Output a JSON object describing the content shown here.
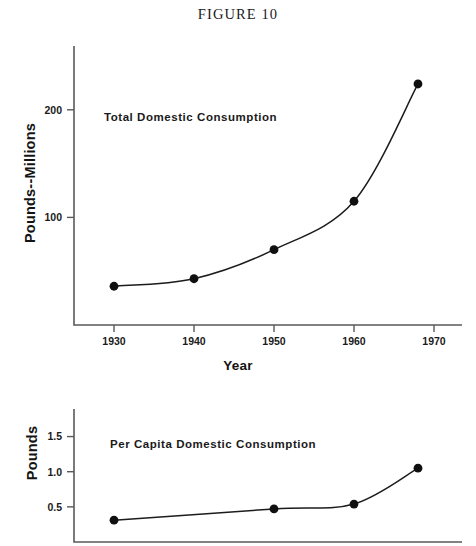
{
  "figure": {
    "title": "FIGURE  10"
  },
  "chart_data": [
    {
      "id": "total-domestic-consumption",
      "type": "line",
      "title": "Total Domestic Consumption",
      "annotation": "Total Domestic Consumption",
      "xlabel": "Year",
      "ylabel": "Pounds--Millions",
      "x": [
        1930,
        1940,
        1950,
        1960,
        1968
      ],
      "values": [
        36,
        43,
        70,
        115,
        224
      ],
      "xticks": [
        1930,
        1940,
        1950,
        1960,
        1970
      ],
      "xticklabels": [
        "1930",
        "1940",
        "1950",
        "1960",
        "1970"
      ],
      "yticks": [
        100,
        200
      ],
      "yticklabels": [
        "100",
        "200"
      ],
      "xlim": [
        1925,
        1972
      ],
      "ylim": [
        0,
        250
      ],
      "grid": false,
      "legend": false,
      "marker": "filled-circle",
      "line_color": "#1c1c1c"
    },
    {
      "id": "per-capita-domestic-consumption",
      "type": "line",
      "title": "Per Capita Domestic Consumption",
      "annotation": "Per Capita Domestic Consumption",
      "xlabel": "",
      "ylabel": "Pounds",
      "x": [
        1930,
        1950,
        1960,
        1968
      ],
      "values": [
        0.31,
        0.47,
        0.54,
        1.05
      ],
      "xticks": [],
      "xticklabels": [],
      "yticks": [
        0.5,
        1.0,
        1.5
      ],
      "yticklabels": [
        "0.5",
        "1.0",
        "1.5"
      ],
      "xlim": [
        1925,
        1972
      ],
      "ylim": [
        0.0,
        1.75
      ],
      "grid": false,
      "legend": false,
      "marker": "filled-circle",
      "line_color": "#1c1c1c"
    }
  ],
  "colors": {
    "ink": "#1c1c1c",
    "axis": "#595959",
    "background": "#ffffff"
  }
}
